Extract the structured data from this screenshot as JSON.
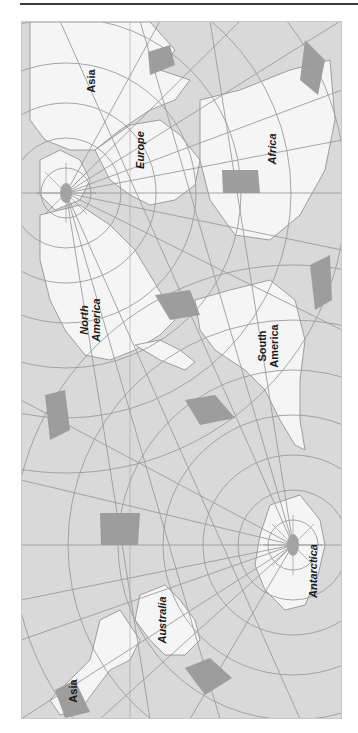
{
  "figure": {
    "type": "world-map",
    "projection_note": "Rotated polar world projection with graticule; labels rotated 90°",
    "colors": {
      "ocean": "#d9d9d9",
      "land": "#f5f5f5",
      "coastline": "#8a8a8a",
      "graticule": "#9c9c9c",
      "highlight_square": "#9a9a9a",
      "pole": "#a3a3a3",
      "rule": "#3a3a3a"
    },
    "labels": {
      "asia_top": "Asia",
      "europe": "Europe",
      "africa": "Africa",
      "north_america_1": "North",
      "north_america_2": "America",
      "south_america_1": "South",
      "south_america_2": "America",
      "australia": "Australia",
      "antarctica": "Antarctica",
      "asia_bottom": "Asia"
    },
    "poles": {
      "north": {
        "x": 66,
        "y": 193
      },
      "south": {
        "x": 293,
        "y": 545
      }
    },
    "highlight_squares_count": 9
  }
}
